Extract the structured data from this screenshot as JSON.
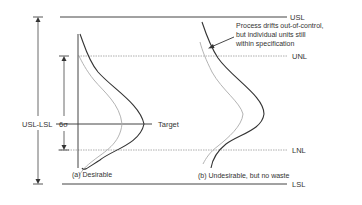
{
  "diagram": {
    "type": "process-control-vs-specification-limits",
    "limits": {
      "usl": "USL",
      "unl": "UNL",
      "lnl": "LNL",
      "lsl": "LSL",
      "target": "Target"
    },
    "spans": {
      "spec_range": "USL-LSL",
      "six_sigma": "6σ"
    },
    "panels": [
      {
        "id": "a",
        "caption": "(a) Desirable"
      },
      {
        "id": "b",
        "caption": "(b) Undesirable, but no waste"
      }
    ],
    "annotation": {
      "lines": [
        "Process drifts out-of-control,",
        "but individual units still",
        "within specification"
      ]
    },
    "colors": {
      "solid_line": "#333333",
      "dotted_line": "#999999",
      "curve_dark": "#333333",
      "curve_light": "#aaaaaa",
      "background": "#ffffff"
    }
  }
}
